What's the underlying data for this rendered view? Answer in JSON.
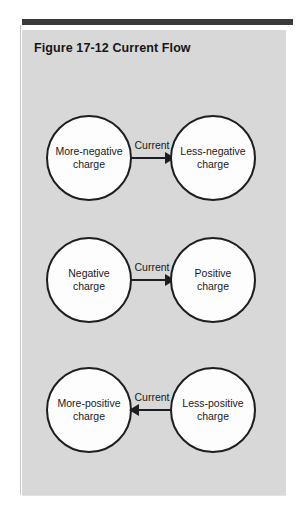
{
  "figure": {
    "title": "Figure 17-12  Current Flow",
    "panel_color": "#d8d8d8",
    "rule_color": "#3a3a3c",
    "outline_color": "#1e1e20",
    "node_fill": "#fdfdfd"
  },
  "diagram": {
    "type": "flow",
    "rows": [
      {
        "left_label": "More-negative\ncharge",
        "right_label": "Less-negative\ncharge",
        "arrow_label": "Current",
        "arrow_direction": "right"
      },
      {
        "left_label": "Negative\ncharge",
        "right_label": "Positive\ncharge",
        "arrow_label": "Current",
        "arrow_direction": "right"
      },
      {
        "left_label": "More-positive\ncharge",
        "right_label": "Less-positive\ncharge",
        "arrow_label": "Current",
        "arrow_direction": "left"
      }
    ]
  }
}
